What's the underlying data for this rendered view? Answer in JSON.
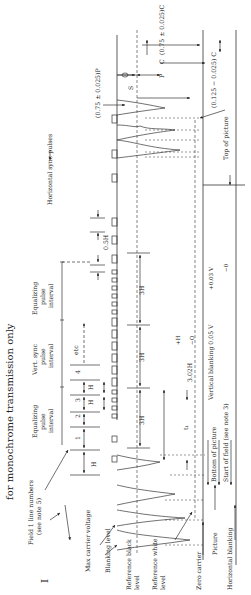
{
  "title": "for monochrome transmission only",
  "figure_label": "I",
  "labels": {
    "field_line_numbers": "Field 1 line numbers",
    "field_line_numbers_note": "(see note 5)",
    "max_carrier": "Max carrier voltage",
    "blanking_level": "Blanking level",
    "ref_black": "Reference black",
    "ref_black_2": "level",
    "ref_white": "Reference white",
    "ref_white_2": "level",
    "zero_carrier": "Zero carrier",
    "picture": "Picture",
    "horizontal_blanking": "Horizontal blanking",
    "bottom_of_picture": "Bottom of picture",
    "start_of_field": "Start of field (see note 3)",
    "vertical_blanking": "Vertical blanking 0.05 V",
    "vb_tol_plus": "+0.03 V",
    "vb_tol_minus": "−0",
    "top_of_picture": "Top of picture",
    "horizontal_sync": "Horizontal sync pulses",
    "eq1_a": "Equalizing",
    "eq1_b": "pulse",
    "eq1_c": "interval",
    "vs_a": "Vert. sync",
    "vs_b": "pulse",
    "vs_c": "interval",
    "eq2_a": "Equalizing",
    "eq2_b": "pulse",
    "eq2_c": "interval",
    "etc": "etc",
    "H": "H",
    "half_H": "0.5H",
    "three_H_1": "3H",
    "three_H_2": "3H",
    "three_H_3": "3H",
    "t1": "t₁",
    "t1_value": "3.02H",
    "t1_plus": "+H",
    "t1_minus": "−O",
    "line_1": "1",
    "line_2": "2",
    "line_3": "3",
    "line_4": "4",
    "P_eq": "(0.75 ± 0.025)P",
    "S": "S",
    "P": "P",
    "C": "C",
    "C_eq": "(0.75 ± 0.025)C",
    "C_eq2": "(0.125 − 0.025) C"
  }
}
